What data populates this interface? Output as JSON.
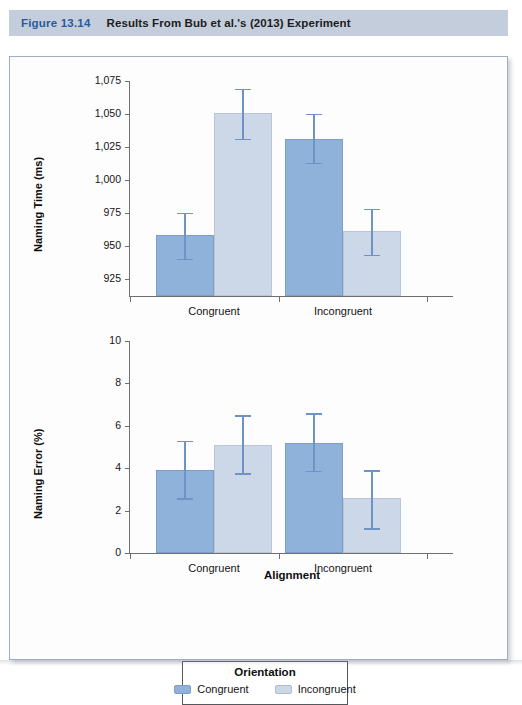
{
  "header": {
    "figure_number": "Figure 13.14",
    "title": "Results From Bub et al.'s (2013) Experiment"
  },
  "colors": {
    "header_band": "#c3cddb",
    "figure_number": "#2a5a9c",
    "bar_congruent": "#8fb2da",
    "bar_incongruent": "#ccd8e8",
    "error_bar": "#6e93c4",
    "axis": "#6f6f6f"
  },
  "legend": {
    "title": "Orientation",
    "items": [
      {
        "label": "Congruent",
        "color": "#8fb2da"
      },
      {
        "label": "Incongruent",
        "color": "#ccd8e8"
      }
    ]
  },
  "chart_data": [
    {
      "type": "bar",
      "title": "",
      "xlabel": "",
      "ylabel": "Naming Time (ms)",
      "categories": [
        "Congruent",
        "Incongruent"
      ],
      "ylim": [
        912,
        1075
      ],
      "yticks": [
        925,
        950,
        975,
        1000,
        1025,
        1050,
        1075
      ],
      "ytick_labels": [
        "925",
        "950",
        "975",
        "1,000",
        "1,025",
        "1,050",
        "1,075"
      ],
      "grid": false,
      "legend_position": "bottom",
      "series": [
        {
          "name": "Congruent",
          "values": [
            958,
            1031
          ],
          "err_low": [
            939,
            1012
          ],
          "err_high": [
            975,
            1050
          ]
        },
        {
          "name": "Incongruent",
          "values": [
            1051,
            961
          ],
          "err_low": [
            1030,
            942
          ],
          "err_high": [
            1069,
            978
          ]
        }
      ]
    },
    {
      "type": "bar",
      "title": "",
      "xlabel": "Alignment",
      "ylabel": "Naming Error (%)",
      "categories": [
        "Congruent",
        "Incongruent"
      ],
      "ylim": [
        0,
        10
      ],
      "yticks": [
        0,
        2,
        4,
        6,
        8,
        10
      ],
      "ytick_labels": [
        "0",
        "2",
        "4",
        "6",
        "8",
        "10"
      ],
      "grid": false,
      "legend_position": "bottom",
      "series": [
        {
          "name": "Congruent",
          "values": [
            3.9,
            5.2
          ],
          "err_low": [
            2.5,
            3.8
          ],
          "err_high": [
            5.3,
            6.6
          ]
        },
        {
          "name": "Incongruent",
          "values": [
            5.1,
            2.6
          ],
          "err_low": [
            3.7,
            1.1
          ],
          "err_high": [
            6.5,
            3.9
          ]
        }
      ]
    }
  ]
}
